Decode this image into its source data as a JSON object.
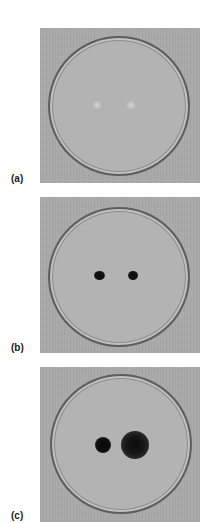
{
  "figure": {
    "panels": [
      {
        "id": "a",
        "label": "(a)",
        "description": "Petri dish with two faint light inoculation spots",
        "spots": [
          {
            "shape": "faint-light",
            "color": "#c9c9c9"
          },
          {
            "shape": "faint-light",
            "color": "#c9c9c9"
          }
        ]
      },
      {
        "id": "b",
        "label": "(b)",
        "description": "Petri dish with two small dark colonies",
        "spots": [
          {
            "shape": "small-dark",
            "color": "#111111"
          },
          {
            "shape": "small-dark",
            "color": "#111111"
          }
        ]
      },
      {
        "id": "c",
        "label": "(c)",
        "description": "Petri dish with one small dark colony and one larger diffuse dark colony",
        "spots": [
          {
            "shape": "round-dark",
            "color": "#0f0f0f"
          },
          {
            "shape": "large-diffuse-dark",
            "color": "#151515"
          }
        ]
      }
    ]
  }
}
